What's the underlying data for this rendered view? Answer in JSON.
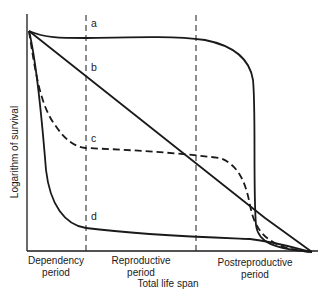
{
  "diagram": {
    "type": "survivorship-curves",
    "y_axis_label": "Logarithm of survival",
    "x_axis_label": "Total life span",
    "periods": [
      {
        "id": "dependency",
        "line1": "Dependency",
        "line2": "period"
      },
      {
        "id": "reproductive",
        "line1": "Reproductive",
        "line2": "period"
      },
      {
        "id": "postreproductive",
        "line1": "Postreproductive",
        "line2": "period"
      }
    ],
    "curves": [
      {
        "id": "a",
        "label": "a",
        "style": "solid",
        "description": "high survival until late life, then sharp drop"
      },
      {
        "id": "b",
        "label": "b",
        "style": "solid",
        "description": "constant rate of decline (straight line)"
      },
      {
        "id": "c",
        "label": "c",
        "style": "dashed",
        "description": "early drop, plateau, late drop"
      },
      {
        "id": "d",
        "label": "d",
        "style": "solid",
        "description": "very high early mortality, then low"
      }
    ],
    "colors": {
      "ink": "#1a1a1a",
      "background": "#ffffff"
    }
  }
}
